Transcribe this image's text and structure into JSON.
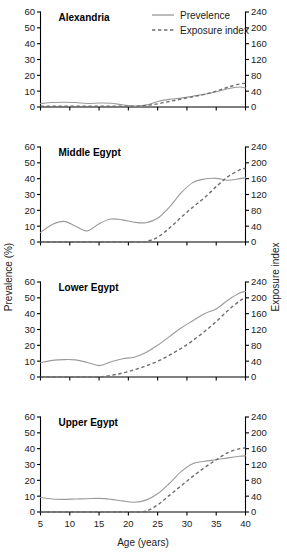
{
  "figure": {
    "xlabel": "Age (years)",
    "ylabel_left": "Prevalence (%)",
    "ylabel_right": "Exposure index",
    "legend": {
      "position": "top-center",
      "entries": [
        {
          "label": "Prevelence",
          "style": "solid",
          "color": "#8f8f8f"
        },
        {
          "label": "Exposure index",
          "style": "dashed",
          "color": "#6e6e6e"
        }
      ]
    }
  },
  "chart_data": {
    "type": "line",
    "title": "",
    "xlabel": "Age (years)",
    "ylabel": "Prevalence (%)",
    "ylabel_secondary": "Exposure index",
    "xlim": [
      5,
      40
    ],
    "xticks": [
      5,
      10,
      15,
      20,
      25,
      30,
      35,
      40
    ],
    "ylim": [
      0,
      60
    ],
    "yticks": [
      0,
      10,
      20,
      30,
      40,
      50,
      60
    ],
    "ylim_secondary": [
      0,
      240
    ],
    "yticks_secondary": [
      0,
      40,
      80,
      120,
      160,
      200,
      240
    ],
    "grid": false,
    "legend_position": "top-center",
    "panels": [
      {
        "title": "Alexandria",
        "x": [
          5,
          7,
          9,
          11,
          13,
          15,
          17,
          19,
          21,
          23,
          25,
          27,
          29,
          31,
          33,
          35,
          37,
          39,
          40
        ],
        "series": [
          {
            "name": "Prevelence",
            "axis": "left",
            "style": "solid",
            "values": [
              2.2,
              2.8,
              3.0,
              2.8,
              2.2,
              2.5,
              2.4,
              1.4,
              0.6,
              1.2,
              3.5,
              4.8,
              5.6,
              6.8,
              8.0,
              9.6,
              11.5,
              12.6,
              12.0
            ]
          },
          {
            "name": "Exposure index",
            "axis": "right",
            "style": "dashed",
            "values": [
              2,
              2,
              2,
              2,
              2,
              2,
              2,
              2,
              2,
              4,
              8,
              14,
              20,
              26,
              32,
              40,
              50,
              58,
              60
            ]
          }
        ]
      },
      {
        "title": "Middle Egypt",
        "x": [
          5,
          7,
          9,
          11,
          13,
          15,
          17,
          19,
          21,
          23,
          25,
          27,
          29,
          31,
          33,
          35,
          37,
          39,
          40
        ],
        "series": [
          {
            "name": "Prevelence",
            "axis": "left",
            "style": "solid",
            "values": [
              6.0,
              11.0,
              13.0,
              10.0,
              7.0,
              11.5,
              14.5,
              14.0,
              12.5,
              12.2,
              15.0,
              22.0,
              31.0,
              37.5,
              39.8,
              40.2,
              39.0,
              40.0,
              40.5
            ]
          },
          {
            "name": "Exposure index",
            "axis": "right",
            "style": "dashed",
            "values": [
              0,
              0,
              0,
              0,
              0,
              0,
              0,
              0,
              0,
              1,
              12,
              35,
              62,
              88,
              112,
              140,
              165,
              182,
              186
            ]
          }
        ]
      },
      {
        "title": "Lower Egypt",
        "x": [
          5,
          7,
          9,
          11,
          13,
          15,
          17,
          19,
          21,
          23,
          25,
          27,
          29,
          31,
          33,
          35,
          37,
          39,
          40
        ],
        "series": [
          {
            "name": "Prevelence",
            "axis": "left",
            "style": "solid",
            "values": [
              9.0,
              10.5,
              11.0,
              10.8,
              9.2,
              7.2,
              9.5,
              11.5,
              12.5,
              15.5,
              20.0,
              25.5,
              31.0,
              35.5,
              40.0,
              43.0,
              48.5,
              53.0,
              54.0
            ]
          },
          {
            "name": "Exposure index",
            "axis": "right",
            "style": "dashed",
            "values": [
              0,
              0,
              0,
              0,
              0,
              0,
              4,
              10,
              18,
              28,
              40,
              55,
              72,
              92,
              115,
              140,
              168,
              192,
              200
            ]
          }
        ]
      },
      {
        "title": "Upper Egypt",
        "x": [
          5,
          7,
          9,
          11,
          13,
          15,
          17,
          19,
          21,
          23,
          25,
          27,
          29,
          31,
          33,
          35,
          37,
          39,
          40
        ],
        "series": [
          {
            "name": "Prevelence",
            "axis": "left",
            "style": "solid",
            "values": [
              9.2,
              8.2,
              8.0,
              8.2,
              8.4,
              8.6,
              8.0,
              7.0,
              6.2,
              7.5,
              11.5,
              18.0,
              25.5,
              30.5,
              32.0,
              33.0,
              34.2,
              35.2,
              35.5
            ]
          },
          {
            "name": "Exposure index",
            "axis": "right",
            "style": "dashed",
            "values": [
              0,
              0,
              0,
              0,
              0,
              0,
              0,
              0,
              0,
              2,
              18,
              42,
              66,
              90,
              112,
              132,
              150,
              160,
              162
            ]
          }
        ]
      }
    ]
  }
}
